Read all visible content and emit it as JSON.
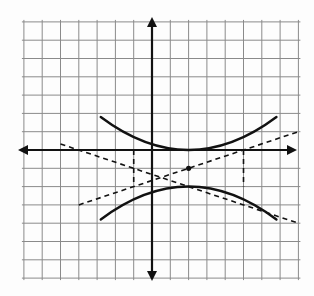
{
  "diagram": {
    "type": "hyperbola-graph",
    "grid": {
      "x_min": -7,
      "x_max": 8,
      "y_min": -7,
      "y_max": 7,
      "cell_px": 18.3,
      "origin_px": [
        152,
        150
      ],
      "grid_color": "#8a8a8a",
      "axis_color": "#111111"
    },
    "hyperbola": {
      "orientation": "vertical",
      "center": [
        2,
        -1
      ],
      "vertices": [
        [
          2,
          0
        ],
        [
          2,
          -2
        ]
      ],
      "upper_branch": [
        [
          -2.8,
          1.8
        ],
        [
          2,
          0
        ],
        [
          6.8,
          1.8
        ]
      ],
      "lower_branch": [
        [
          -2.8,
          -3.8
        ],
        [
          2,
          -2
        ],
        [
          6.8,
          -3.8
        ]
      ]
    },
    "asymptotes": [
      {
        "from": [
          -5,
          0.33
        ],
        "to": [
          8,
          -4
        ],
        "style": "dashed"
      },
      {
        "from": [
          -4,
          -3
        ],
        "to": [
          8,
          1
        ],
        "style": "dashed"
      }
    ],
    "fundamental_box": {
      "x_left": -1,
      "x_right": 5,
      "y_top": 0,
      "y_bottom": -2,
      "style": "dashed"
    },
    "center_marker": [
      2,
      -1
    ]
  }
}
